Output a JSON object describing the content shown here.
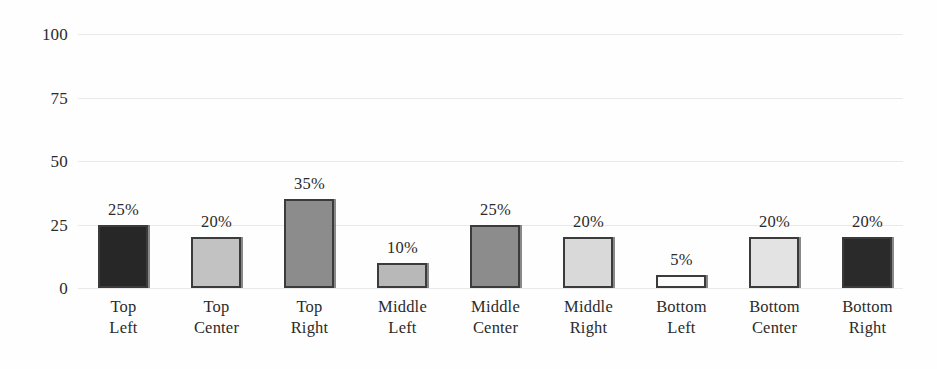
{
  "chart_data": {
    "type": "bar",
    "title": "",
    "subtitle": "",
    "xlabel": "",
    "ylabel": "",
    "ylim": [
      0,
      100
    ],
    "yticks": [
      0,
      25,
      50,
      75,
      100
    ],
    "ytick_labels": [
      "0",
      "25",
      "50",
      "75",
      "100"
    ],
    "grid": true,
    "grid_axis": "y",
    "legend": false,
    "legend_position": "none",
    "categories": [
      "Top Left",
      "Top Center",
      "Top Right",
      "Middle Left",
      "Middle Center",
      "Middle Right",
      "Bottom Left",
      "Bottom Center",
      "Bottom Right"
    ],
    "category_lines": [
      [
        "Top",
        "Left"
      ],
      [
        "Top",
        "Center"
      ],
      [
        "Top",
        "Right"
      ],
      [
        "Middle",
        "Left"
      ],
      [
        "Middle",
        "Center"
      ],
      [
        "Middle",
        "Right"
      ],
      [
        "Bottom",
        "Left"
      ],
      [
        "Bottom",
        "Center"
      ],
      [
        "Bottom",
        "Right"
      ]
    ],
    "values": [
      25,
      20,
      35,
      10,
      25,
      20,
      5,
      20,
      20
    ],
    "data_labels": [
      "25%",
      "20%",
      "35%",
      "10%",
      "25%",
      "20%",
      "5%",
      "20%",
      "20%"
    ],
    "bar_colors": [
      "#272727",
      "#c2c2c2",
      "#8c8c8c",
      "#b8b8b8",
      "#8c8c8c",
      "#d9d9d9",
      "#fbfbfb",
      "#e3e3e3",
      "#2a2a2a"
    ],
    "bar_border_color": "#3b3b3b",
    "gridline_color": "#e9e9e9",
    "axis_text_color": "#2b2b2b",
    "background_color": "#fefefe"
  },
  "bars": [
    {
      "label_line1": "Top",
      "label_line2": "Left",
      "value_label": "25%",
      "value": 25,
      "color": "#272727"
    },
    {
      "label_line1": "Top",
      "label_line2": "Center",
      "value_label": "20%",
      "value": 20,
      "color": "#c2c2c2"
    },
    {
      "label_line1": "Top",
      "label_line2": "Right",
      "value_label": "35%",
      "value": 35,
      "color": "#8c8c8c"
    },
    {
      "label_line1": "Middle",
      "label_line2": "Left",
      "value_label": "10%",
      "value": 10,
      "color": "#b8b8b8"
    },
    {
      "label_line1": "Middle",
      "label_line2": "Center",
      "value_label": "25%",
      "value": 25,
      "color": "#8c8c8c"
    },
    {
      "label_line1": "Middle",
      "label_line2": "Right",
      "value_label": "20%",
      "value": 20,
      "color": "#d9d9d9"
    },
    {
      "label_line1": "Bottom",
      "label_line2": "Left",
      "value_label": "5%",
      "value": 5,
      "color": "#fbfbfb"
    },
    {
      "label_line1": "Bottom",
      "label_line2": "Center",
      "value_label": "20%",
      "value": 20,
      "color": "#e3e3e3"
    },
    {
      "label_line1": "Bottom",
      "label_line2": "Right",
      "value_label": "20%",
      "value": 20,
      "color": "#2a2a2a"
    }
  ],
  "yaxis": {
    "ticks": [
      {
        "label": "100",
        "value": 100
      },
      {
        "label": "75",
        "value": 75
      },
      {
        "label": "50",
        "value": 50
      },
      {
        "label": "25",
        "value": 25
      },
      {
        "label": "0",
        "value": 0
      }
    ]
  }
}
